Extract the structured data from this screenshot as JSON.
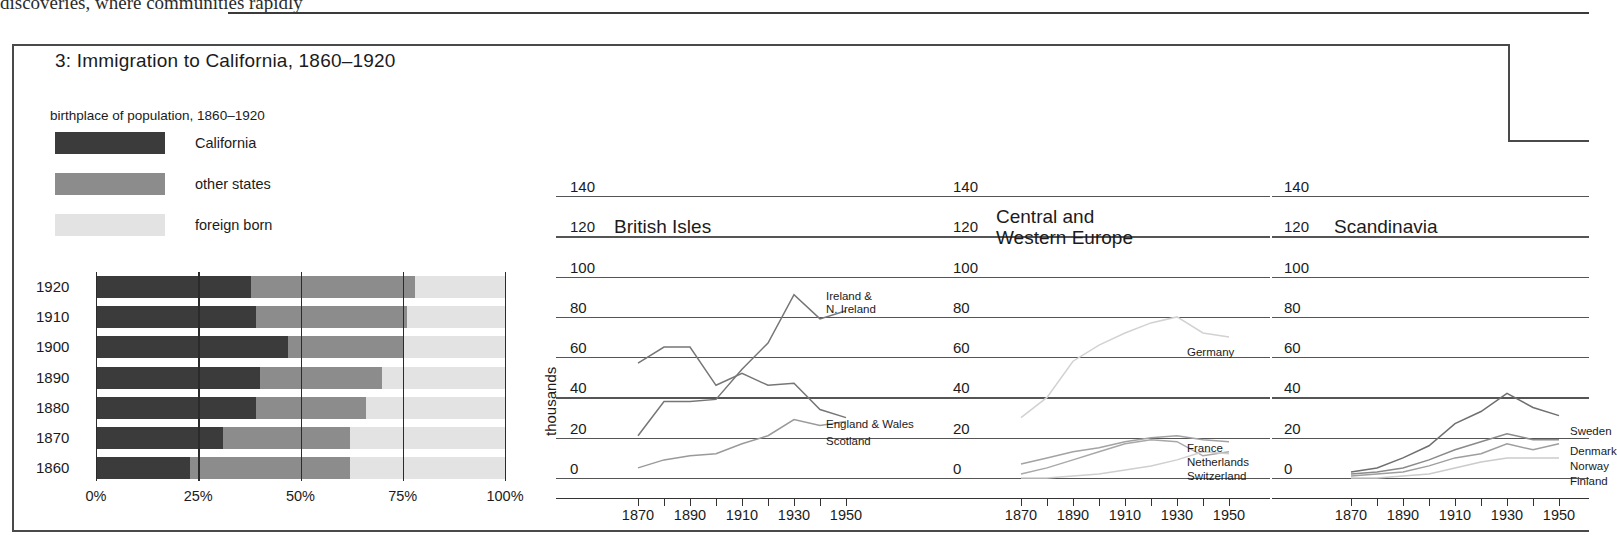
{
  "page": {
    "top_text": "discoveries,    where    communities    rapidly"
  },
  "figure": {
    "title": "3: Immigration to California, 1860–1920",
    "subtitle": "birthplace of population, 1860–1920"
  },
  "legend": {
    "items": [
      {
        "label": "California",
        "color": "#3b3b3b"
      },
      {
        "label": "other states",
        "color": "#8c8c8c"
      },
      {
        "label": "foreign born",
        "color": "#e3e3e3"
      }
    ]
  },
  "chart_data": [
    {
      "type": "bar",
      "subtype": "stacked-horizontal-100",
      "title": "birthplace of population, 1860–1920",
      "xlabel": "",
      "ylabel": "",
      "xlim": [
        0,
        100
      ],
      "xticks": [
        "0%",
        "25%",
        "50%",
        "75%",
        "100%"
      ],
      "xtick_values": [
        0,
        25,
        50,
        75,
        100
      ],
      "grid": true,
      "legend_position": "above-left",
      "categories": [
        "1920",
        "1910",
        "1900",
        "1890",
        "1880",
        "1870",
        "1860"
      ],
      "series": [
        {
          "name": "California",
          "color": "#3b3b3b",
          "values": [
            38,
            39,
            47,
            40,
            39,
            31,
            23
          ]
        },
        {
          "name": "other states",
          "color": "#8c8c8c",
          "values": [
            40,
            37,
            28,
            30,
            27,
            31,
            39
          ]
        },
        {
          "name": "foreign born",
          "color": "#e3e3e3",
          "values": [
            22,
            24,
            25,
            30,
            34,
            38,
            38
          ]
        }
      ]
    },
    {
      "type": "line",
      "title": "British Isles",
      "ylabel": "thousands",
      "ylim": [
        0,
        140
      ],
      "yticks": [
        0,
        20,
        40,
        60,
        80,
        100,
        120,
        140
      ],
      "xlim": [
        1860,
        1960
      ],
      "xticks": [
        1870,
        1890,
        1910,
        1930,
        1950
      ],
      "xticks_minor": [
        1870,
        1880,
        1890,
        1900,
        1910,
        1920,
        1930,
        1940,
        1950
      ],
      "grid": true,
      "x": [
        1870,
        1880,
        1890,
        1900,
        1910,
        1920,
        1930,
        1940,
        1950
      ],
      "series": [
        {
          "name": "Ireland & N. Ireland",
          "label": "Ireland &\nN. Ireland",
          "color": "#767676",
          "values": [
            21,
            38,
            38,
            39,
            54,
            67,
            91,
            79,
            83
          ]
        },
        {
          "name": "England & Wales",
          "label": "England & Wales",
          "color": "#767676",
          "values": [
            57,
            65,
            65,
            46,
            52,
            46,
            47,
            34,
            30
          ]
        },
        {
          "name": "Scotland",
          "label": "Scotland",
          "color": "#9a9a9a",
          "values": [
            5,
            9,
            11,
            12,
            17,
            21,
            29,
            26,
            28
          ]
        }
      ]
    },
    {
      "type": "line",
      "title": "Central and Western Europe",
      "ylabel": "thousands",
      "ylim": [
        0,
        140
      ],
      "yticks": [
        0,
        20,
        40,
        60,
        80,
        100,
        120,
        140
      ],
      "xlim": [
        1860,
        1960
      ],
      "xticks": [
        1870,
        1890,
        1910,
        1930,
        1950
      ],
      "xticks_minor": [
        1870,
        1880,
        1890,
        1900,
        1910,
        1920,
        1930,
        1940,
        1950
      ],
      "grid": true,
      "x": [
        1870,
        1880,
        1890,
        1900,
        1910,
        1920,
        1930,
        1940,
        1950
      ],
      "series": [
        {
          "name": "Germany",
          "label": "Germany",
          "color": "#d2d2d2",
          "values": [
            30,
            40,
            58,
            66,
            72,
            77,
            80,
            72,
            70
          ]
        },
        {
          "name": "France",
          "label": "France",
          "color": "#a3a3a3",
          "values": [
            7,
            10,
            13,
            15,
            18,
            20,
            21,
            19,
            18
          ]
        },
        {
          "name": "Netherlands",
          "label": "Netherlands",
          "color": "#a8a8a8",
          "values": [
            2,
            5,
            9,
            13,
            17,
            19,
            18,
            11,
            13
          ]
        },
        {
          "name": "Switzerland",
          "label": "Switzerland",
          "color": "#cfcfcf",
          "values": [
            0,
            0,
            1,
            2,
            4,
            6,
            9,
            13,
            12
          ]
        }
      ]
    },
    {
      "type": "line",
      "title": "Scandinavia",
      "ylabel": "thousands",
      "ylim": [
        0,
        140
      ],
      "yticks": [
        0,
        20,
        40,
        60,
        80,
        100,
        120,
        140
      ],
      "xlim": [
        1860,
        1960
      ],
      "xticks": [
        1870,
        1890,
        1910,
        1930,
        1950
      ],
      "xticks_minor": [
        1870,
        1880,
        1890,
        1900,
        1910,
        1920,
        1930,
        1940,
        1950
      ],
      "grid": true,
      "x": [
        1870,
        1880,
        1890,
        1900,
        1910,
        1920,
        1930,
        1940,
        1950
      ],
      "series": [
        {
          "name": "Sweden",
          "label": "Sweden",
          "color": "#6f6f6f",
          "values": [
            3,
            5,
            10,
            16,
            27,
            33,
            42,
            35,
            31
          ]
        },
        {
          "name": "Denmark",
          "label": "Denmark",
          "color": "#8a8a8a",
          "values": [
            2,
            3,
            5,
            9,
            14,
            18,
            22,
            19,
            19
          ]
        },
        {
          "name": "Norway",
          "label": "Norway",
          "color": "#9e9e9e",
          "values": [
            1,
            2,
            3,
            6,
            10,
            12,
            17,
            14,
            17
          ]
        },
        {
          "name": "Finland",
          "label": "Finland",
          "color": "#cbcbcb",
          "values": [
            0,
            0,
            1,
            2,
            5,
            8,
            10,
            10,
            10
          ]
        }
      ]
    }
  ],
  "panels": {
    "bar": {
      "xticks": [
        "0%",
        "25%",
        "50%",
        "75%",
        "100%"
      ],
      "rows": [
        "1920",
        "1910",
        "1900",
        "1890",
        "1880",
        "1870",
        "1860"
      ]
    },
    "common": {
      "ylabel": "thousands",
      "gridlabels": [
        "140",
        "120",
        "100",
        "80",
        "60",
        "40",
        "20",
        "0"
      ],
      "xlabels": [
        "1870",
        "1890",
        "1910",
        "1930",
        "1950"
      ]
    },
    "british": {
      "title": "British Isles",
      "labels": {
        "ireland1": "Ireland &",
        "ireland2": "N. Ireland",
        "england": "England & Wales",
        "scotland": "Scotland"
      }
    },
    "central": {
      "title1": "Central and",
      "title2": "Western Europe",
      "labels": {
        "germany": "Germany",
        "france": "France",
        "netherlands": "Netherlands",
        "switzerland": "Switzerland"
      }
    },
    "scandinavia": {
      "title": "Scandinavia",
      "labels": {
        "sweden": "Sweden",
        "denmark": "Denmark",
        "norway": "Norway",
        "finland": "Finland"
      }
    }
  }
}
